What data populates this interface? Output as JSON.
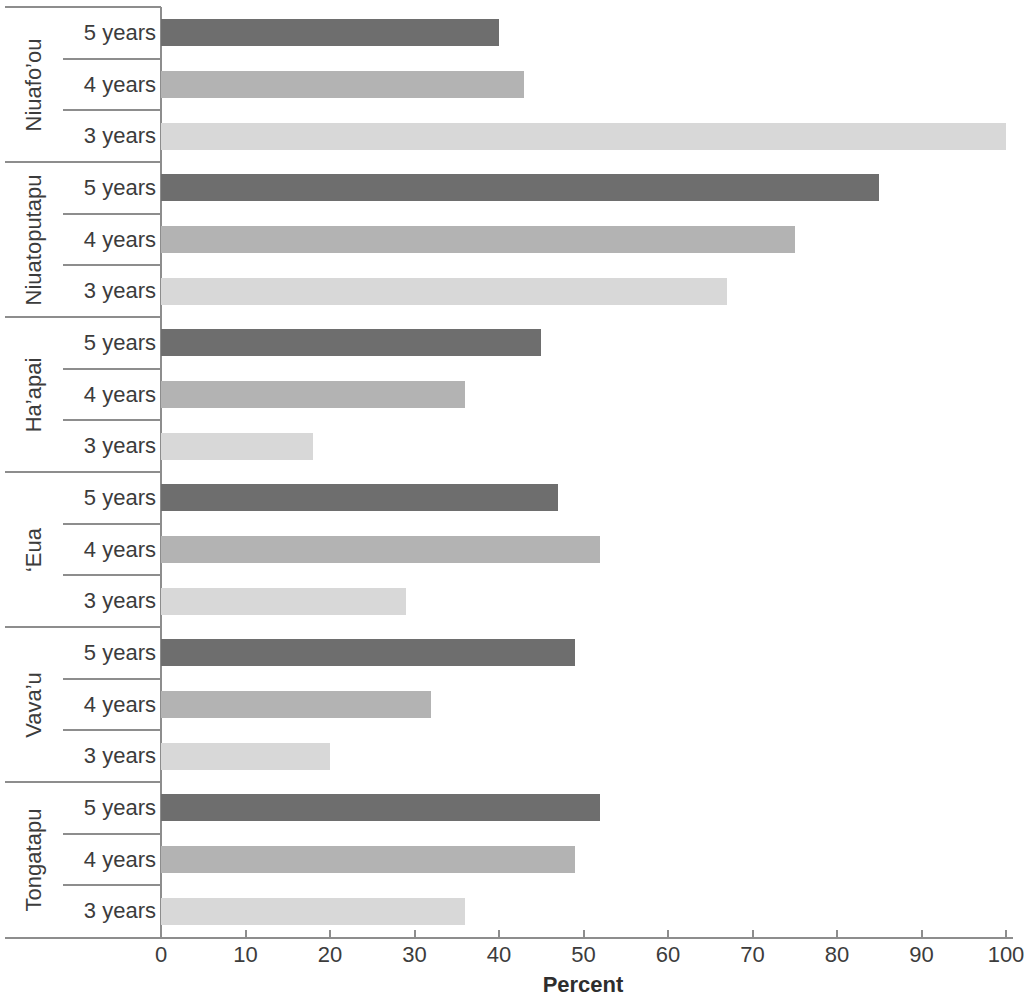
{
  "chart_data": {
    "type": "bar",
    "orientation": "horizontal",
    "title": "",
    "xlabel": "Percent",
    "ylabel": "",
    "xlim": [
      0,
      100
    ],
    "xticks": [
      0,
      10,
      20,
      30,
      40,
      50,
      60,
      70,
      80,
      90,
      100
    ],
    "xtick_labels": [
      "0",
      "10",
      "20",
      "30",
      "40",
      "50",
      "60",
      "70",
      "80",
      "90",
      "100"
    ],
    "grid": false,
    "legend": "none",
    "categories": [
      "5 years",
      "4 years",
      "3 years"
    ],
    "series_colors": {
      "5 years": "#6e6e6e",
      "4 years": "#b3b3b3",
      "3 years": "#d8d8d8"
    },
    "groups": [
      {
        "name": "Niuafo’ou",
        "bars": [
          {
            "category": "5 years",
            "value": 40
          },
          {
            "category": "4 years",
            "value": 43
          },
          {
            "category": "3 years",
            "value": 100
          }
        ]
      },
      {
        "name": "Niuatoputapu",
        "bars": [
          {
            "category": "5 years",
            "value": 85
          },
          {
            "category": "4 years",
            "value": 75
          },
          {
            "category": "3 years",
            "value": 67
          }
        ]
      },
      {
        "name": "Ha’apai",
        "bars": [
          {
            "category": "5 years",
            "value": 45
          },
          {
            "category": "4 years",
            "value": 36
          },
          {
            "category": "3 years",
            "value": 18
          }
        ]
      },
      {
        "name": "‘Eua",
        "bars": [
          {
            "category": "5 years",
            "value": 47
          },
          {
            "category": "4 years",
            "value": 52
          },
          {
            "category": "3 years",
            "value": 29
          }
        ]
      },
      {
        "name": "Vava’u",
        "bars": [
          {
            "category": "5 years",
            "value": 49
          },
          {
            "category": "4 years",
            "value": 32
          },
          {
            "category": "3 years",
            "value": 20
          }
        ]
      },
      {
        "name": "Tongatapu",
        "bars": [
          {
            "category": "5 years",
            "value": 52
          },
          {
            "category": "4 years",
            "value": 49
          },
          {
            "category": "3 years",
            "value": 36
          }
        ]
      }
    ]
  }
}
